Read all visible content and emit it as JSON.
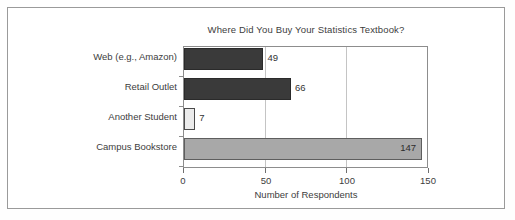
{
  "chart_data": {
    "type": "bar",
    "orientation": "horizontal",
    "title": "Where Did You Buy Your Statistics Textbook?",
    "xlabel": "Number of Respondents",
    "ylabel": "",
    "categories": [
      "Web (e.g., Amazon)",
      "Retail Outlet",
      "Another Student",
      "Campus Bookstore"
    ],
    "values": [
      49,
      66,
      7,
      147
    ],
    "value_labels": [
      "49",
      "66",
      "7",
      "147"
    ],
    "bar_colors": [
      "#3a3a3a",
      "#3a3a3a",
      "#ebebeb",
      "#a8a8a8"
    ],
    "bar_border_colors": [
      "#2a2a2a",
      "#2a2a2a",
      "#4a4a4a",
      "#5e5e5e"
    ],
    "label_inside": [
      false,
      false,
      false,
      true
    ],
    "xlim": [
      0,
      150
    ],
    "xticks": [
      0,
      50,
      100,
      150
    ],
    "xticklabels": [
      "0",
      "50",
      "100",
      "150"
    ],
    "gridlines_x": [
      50,
      100
    ],
    "grid": true,
    "legend": false,
    "legend_position": "none"
  },
  "figure": {
    "frame_color": "#9a9a9a",
    "axis_color": "#8d8d8d",
    "grid_color": "#c4c4c4",
    "background": "#ffffff",
    "text_color": "#3d3d3d"
  }
}
